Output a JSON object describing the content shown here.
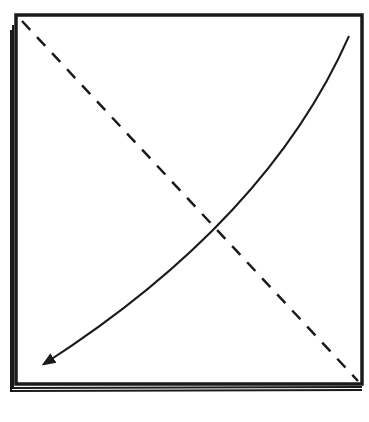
{
  "diagram": {
    "background": "#ffffff",
    "stroke_color": "#1a1a1a",
    "frame": {
      "x": 16,
      "y": 15,
      "width": 346,
      "height": 368,
      "stack_offsets": [
        0,
        3,
        6
      ]
    },
    "dashed_line": {
      "from": [
        22,
        20
      ],
      "to": [
        358,
        381
      ],
      "dash": "12 10"
    },
    "curved_arrow": {
      "start": [
        349,
        36
      ],
      "control": [
        260,
        210
      ],
      "end": [
        42,
        366
      ]
    }
  }
}
